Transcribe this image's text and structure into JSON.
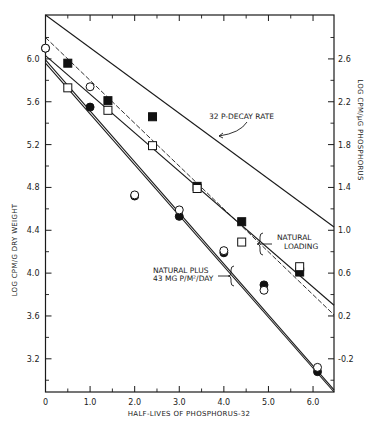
{
  "chart_data": {
    "type": "scatter",
    "title": "",
    "xlabel": "HALF-LIVES OF PHOSPHORUS-32",
    "ylabel": "LOG CPM/G DRY WEIGHT",
    "y2label": "LOG CPM/μG PHOSPHORUS",
    "xlim": [
      0,
      6.47
    ],
    "ylim": [
      2.89,
      6.41
    ],
    "y2_offset": -3.4,
    "grid": false,
    "x_ticks": [
      {
        "v": 0,
        "label": "0"
      },
      {
        "v": 1,
        "label": "1.0"
      },
      {
        "v": 2,
        "label": "2.0"
      },
      {
        "v": 3,
        "label": "3.0"
      },
      {
        "v": 4,
        "label": "4.0"
      },
      {
        "v": 5,
        "label": "5.0"
      },
      {
        "v": 6,
        "label": "6.0"
      }
    ],
    "x_minor_ticks": [
      0.5,
      1.5,
      2.5,
      3.5,
      4.5,
      5.5
    ],
    "y_ticks": [
      {
        "v": 6.0,
        "label": "6.0"
      },
      {
        "v": 5.6,
        "label": "5.6"
      },
      {
        "v": 5.2,
        "label": "5.2"
      },
      {
        "v": 4.8,
        "label": "4.8"
      },
      {
        "v": 4.4,
        "label": "4.4"
      },
      {
        "v": 4.0,
        "label": "4.0"
      },
      {
        "v": 3.6,
        "label": "3.6"
      },
      {
        "v": 3.2,
        "label": "3.2"
      }
    ],
    "y_minor_ticks": [
      6.2,
      5.8,
      5.4,
      5.0,
      4.6,
      4.2,
      3.8,
      3.4,
      3.0
    ],
    "y2_ticks": [
      {
        "v": 6.0,
        "label": "2.6"
      },
      {
        "v": 5.6,
        "label": "2.2"
      },
      {
        "v": 5.2,
        "label": "1.8"
      },
      {
        "v": 4.8,
        "label": "1.4"
      },
      {
        "v": 4.4,
        "label": "1.0"
      },
      {
        "v": 4.0,
        "label": "0.6"
      },
      {
        "v": 3.6,
        "label": "0.2"
      },
      {
        "v": 3.2,
        "label": "-0.2"
      }
    ],
    "series": [
      {
        "name": "Natural loading (dry weight)",
        "marker": "filled-square",
        "x": [
          0.5,
          1.4,
          2.4,
          3.4,
          4.4,
          5.7
        ],
        "y": [
          5.96,
          5.61,
          5.46,
          4.81,
          4.48,
          4.01
        ]
      },
      {
        "name": "Natural loading (phosphorus)",
        "marker": "open-square",
        "x": [
          0.5,
          1.4,
          2.4,
          3.4,
          4.4,
          5.7
        ],
        "y": [
          5.73,
          5.52,
          5.19,
          4.79,
          4.29,
          4.06
        ]
      },
      {
        "name": "Natural plus 43 mg P/m2/day (dry weight)",
        "marker": "filled-circle",
        "x": [
          0.0,
          1.0,
          2.0,
          3.0,
          4.0,
          4.9,
          6.1
        ],
        "y": [
          6.1,
          5.55,
          4.72,
          4.53,
          4.19,
          3.89,
          3.08
        ]
      },
      {
        "name": "Natural plus 43 mg P/m2/day (phosphorus)",
        "marker": "open-circle",
        "x": [
          0.0,
          1.0,
          2.0,
          3.0,
          4.0,
          4.9,
          6.1
        ],
        "y": [
          6.1,
          5.74,
          4.73,
          4.59,
          4.21,
          3.84,
          3.12
        ]
      }
    ],
    "lines": [
      {
        "name": "32 P-decay rate",
        "style": "solid",
        "x": [
          0,
          6.47
        ],
        "y": [
          6.41,
          4.43
        ]
      },
      {
        "name": "Natural loading fit A",
        "style": "solid",
        "x": [
          0,
          6.47
        ],
        "y": [
          6.03,
          3.7
        ]
      },
      {
        "name": "Natural loading fit B",
        "style": "dashed",
        "x": [
          0,
          6.47
        ],
        "y": [
          6.2,
          3.61
        ]
      },
      {
        "name": "Natural plus fit A",
        "style": "solid",
        "x": [
          0,
          6.47
        ],
        "y": [
          5.99,
          2.91
        ]
      },
      {
        "name": "Natural plus fit B",
        "style": "solid",
        "x": [
          0,
          6.47
        ],
        "y": [
          5.96,
          2.89
        ]
      }
    ],
    "annotations": [
      {
        "text": "32 P-DECAY RATE"
      },
      {
        "text_lines": [
          "NATURAL",
          "LOADING"
        ]
      },
      {
        "text_lines": [
          "NATURAL PLUS",
          "43 MG P/M²/DAY"
        ]
      }
    ]
  }
}
